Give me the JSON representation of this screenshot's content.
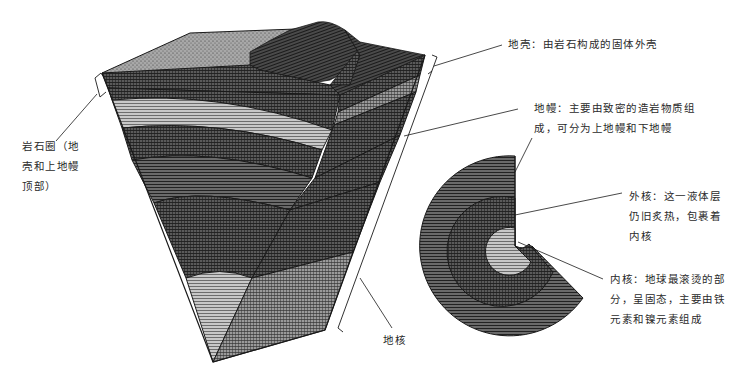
{
  "diagram": {
    "title": "",
    "labels": {
      "lithosphere": "岩石圈（地\n壳和上地幔\n顶部）",
      "crust": "地壳：由岩石构成的固体外壳",
      "mantle": "地幔：主要由致密的造岩物质组\n成，可分为上地幔和下地幔",
      "outer_core": "外核：这一液体层\n仍旧炙热，包裹着\n内核",
      "inner_core": "内核：地球最滚烫的部\n分，呈固态，主要由铁\n元素和镍元素组成",
      "core": "地核"
    },
    "components": [
      {
        "id": "earth-wedge",
        "description": "3D cutaway wedge of Earth layers"
      },
      {
        "id": "core-cross-section",
        "description": "Cross-section of outer and inner core"
      }
    ],
    "colors": {
      "outline": "#1a1a1a",
      "dark_fill": "#3a3a3a",
      "mid_fill": "#5a5a5a",
      "light_fill": "#9a9a9a",
      "crust_top": "#8a8a8a",
      "background": "#ffffff"
    }
  }
}
